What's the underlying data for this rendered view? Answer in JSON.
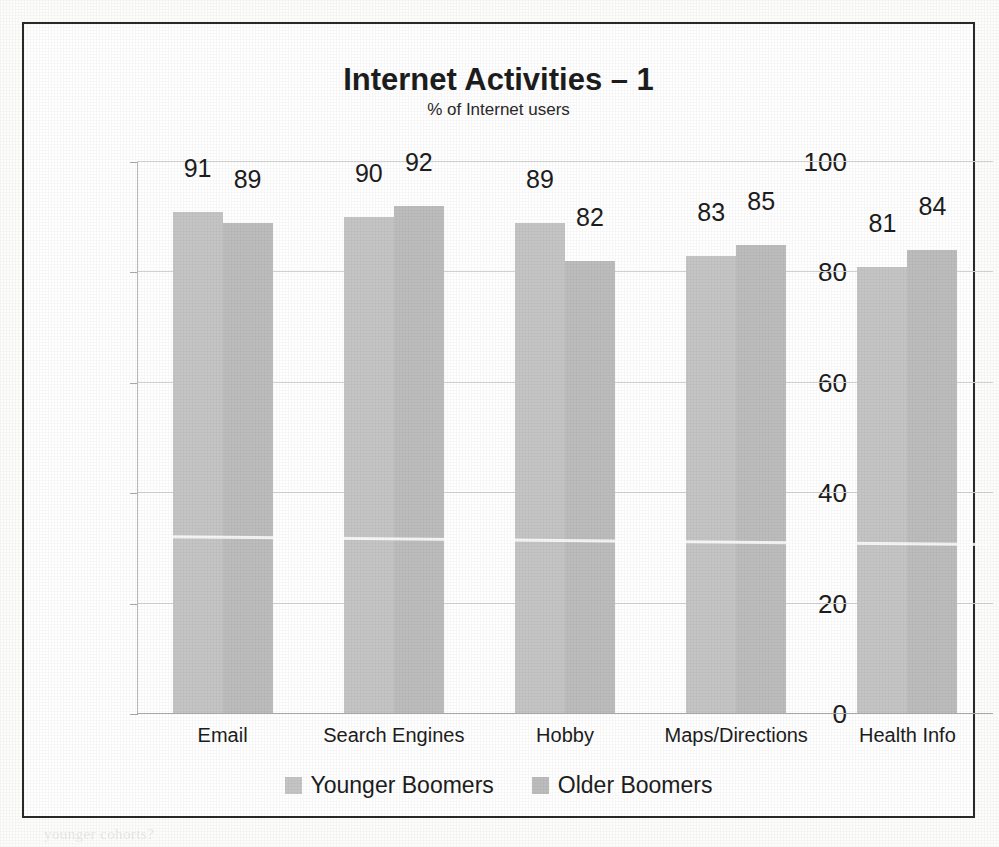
{
  "chart_data": {
    "type": "bar",
    "title": "Internet Activities – 1",
    "subtitle": "% of Internet users",
    "xlabel": "",
    "ylabel": "",
    "ylim": [
      0,
      100
    ],
    "yticks": [
      0,
      20,
      40,
      60,
      80,
      100
    ],
    "grid": true,
    "legend_position": "bottom",
    "categories": [
      "Email",
      "Search Engines",
      "Hobby",
      "Maps/Directions",
      "Health Info"
    ],
    "series": [
      {
        "name": "Younger Boomers",
        "color": "#c5c5c5",
        "values": [
          91,
          90,
          89,
          83,
          81
        ]
      },
      {
        "name": "Older Boomers",
        "color": "#bdbdbd",
        "values": [
          89,
          92,
          82,
          85,
          84
        ]
      }
    ]
  },
  "frame": {
    "border_color": "#2a2a2a",
    "background": "#ffffff"
  },
  "background_bleed": [
    "ation and computing technology, but Internet",
    "oomers are heavy users of the Web and Older",
    "ors, but overall Internet use declines with age.",
    "d increase in the rate of Internet adoption among",
    "he same dramatic rate of growth has not been",
    "increase in Internet use as a whole",
    "p the Older and Younger Boomer",
    "of social networking sites as well as",
    "ill not matched those of younger",
    "ce the mid-range of the age spectrum",
    "on reach? Will this trend of social media",
    "nue to grow as the Boomer population ages",
    "ut in the primary adopters remain the",
    "younger cohorts?"
  ]
}
